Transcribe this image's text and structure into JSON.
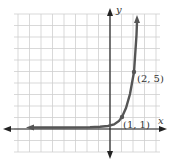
{
  "chart_data": {
    "type": "line",
    "title": "",
    "xlabel": "x",
    "ylabel": "y",
    "xlim": [
      -9,
      4
    ],
    "ylim": [
      -3,
      10
    ],
    "grid": true,
    "function": "exponential growth, y = 5^(x-1)",
    "series": [
      {
        "name": "curve",
        "x": [
          -8,
          -4,
          -2,
          -1,
          0,
          0.5,
          1,
          1.5,
          2,
          2.3
        ],
        "y": [
          0.0,
          0.0,
          0.008,
          0.04,
          0.2,
          0.45,
          1,
          2.24,
          5,
          8.1
        ]
      }
    ],
    "annotations": [
      {
        "label": "(1, 1)",
        "x": 1,
        "y": 1
      },
      {
        "label": "(2, 5)",
        "x": 2,
        "y": 5
      }
    ]
  },
  "labels": {
    "x_axis": "x",
    "y_axis": "y",
    "point1": "(1, 1)",
    "point2": "(2, 5)"
  },
  "colors": {
    "curve": "#555555",
    "grid": "#cccccc",
    "axis": "#222222"
  }
}
